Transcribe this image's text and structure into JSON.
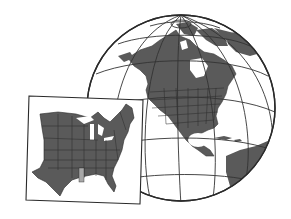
{
  "illustration": {
    "subject": "Globe showing North America with inset map of the eastern United States",
    "colors": {
      "background": "#ffffff",
      "land": "#5a5a5a",
      "outline": "#2a2a2a",
      "graticule": "#333333",
      "highlight_state": "#a8a8a8",
      "water": "#ffffff"
    },
    "globe": {
      "cx": 181,
      "cy": 108,
      "rx": 94,
      "ry": 93
    },
    "inset": {
      "highlighted_state": "Mississippi"
    }
  }
}
